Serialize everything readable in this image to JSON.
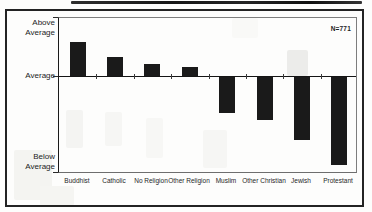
{
  "chart_data": {
    "type": "bar",
    "title": "",
    "categories": [
      "Buddhist",
      "Catholic",
      "No Religion",
      "Other Religion",
      "Muslim",
      "Other Christian",
      "Jewish",
      "Protestant"
    ],
    "values": [
      0.34,
      0.19,
      0.12,
      0.09,
      -0.36,
      -0.43,
      -0.63,
      -0.88
    ],
    "value_units": "relative to average (axis unlabeled numerically; values estimated from bar heights)",
    "y_axis_tick_labels": [
      "Above Average",
      "Average",
      "Below Average"
    ],
    "xlabel": "",
    "ylabel": "",
    "ylim": [
      -0.97,
      0.59
    ],
    "annotation": "N=771",
    "bar_color": "#1a1a1a",
    "grid": "off",
    "legend": "none",
    "baseline_label": "Average"
  }
}
